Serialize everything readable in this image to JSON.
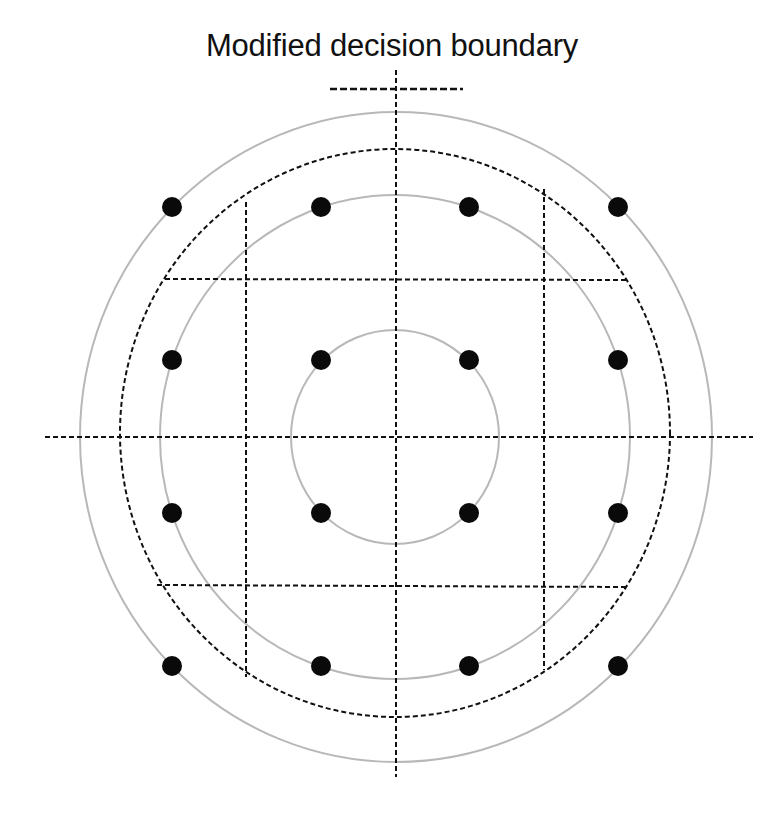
{
  "title": "Modified decision boundary",
  "colors": {
    "background": "#ffffff",
    "circle_gray": "#b8b8b8",
    "dashed_line": "#111111",
    "dot": "#0a0a0a",
    "text": "#111111"
  },
  "diagram": {
    "type": "constellation-decision-boundary",
    "center": [
      396,
      437
    ],
    "legend_dash": {
      "x1": 330,
      "x2": 463,
      "y": 89
    },
    "axes": {
      "horizontal": {
        "x1": 45,
        "x2": 753,
        "y": 437
      },
      "vertical": {
        "x": 396,
        "y1": 70,
        "y2": 777
      }
    },
    "gray_circles": [
      {
        "name": "inner",
        "cx": 395,
        "cy": 437,
        "rx": 104,
        "ry": 107
      },
      {
        "name": "middle",
        "cx": 395,
        "cy": 437,
        "rx": 235,
        "ry": 242
      },
      {
        "name": "outer",
        "cx": 396,
        "cy": 437,
        "rx": 316,
        "ry": 325
      }
    ],
    "dashed_circle": {
      "cx": 395,
      "cy": 433,
      "rx": 275,
      "ry": 284
    },
    "grid_lines": [
      {
        "x1": 246,
        "y1": 202,
        "x2": 246,
        "y2": 677
      },
      {
        "x1": 544,
        "y1": 189,
        "x2": 544,
        "y2": 670
      },
      {
        "x1": 165,
        "y1": 279,
        "x2": 629,
        "y2": 280
      },
      {
        "x1": 157,
        "y1": 585,
        "x2": 628,
        "y2": 587
      }
    ],
    "dot_radius": 10,
    "points": [
      [
        172,
        207
      ],
      [
        321,
        207
      ],
      [
        469,
        207
      ],
      [
        618,
        207
      ],
      [
        172,
        360
      ],
      [
        321,
        360
      ],
      [
        469,
        360
      ],
      [
        618,
        360
      ],
      [
        172,
        513
      ],
      [
        321,
        513
      ],
      [
        469,
        513
      ],
      [
        618,
        513
      ],
      [
        172,
        666
      ],
      [
        321,
        666
      ],
      [
        469,
        666
      ],
      [
        618,
        666
      ]
    ]
  }
}
